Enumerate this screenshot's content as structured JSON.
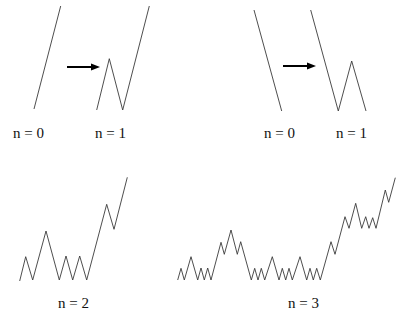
{
  "figure": {
    "stroke_color": "#3a3a3a",
    "arrow_color": "#000000",
    "background": "#ffffff"
  },
  "panels": [
    {
      "id": "top-left",
      "description": "Increasing generator: straight line (n = 0) replaced by zigzag (n = 1)",
      "n0": {
        "label": "n = 0",
        "points": [
          [
            34,
            109
          ],
          [
            60.7,
            6
          ]
        ]
      },
      "arrow": {
        "from": [
          67,
          67
        ],
        "to": [
          100,
          67
        ]
      },
      "n1": {
        "label": "n = 1",
        "points": [
          [
            96.7,
            110
          ],
          [
            109.3,
            58.7
          ],
          [
            122.7,
            110
          ],
          [
            149.3,
            6
          ]
        ]
      }
    },
    {
      "id": "top-right",
      "description": "Decreasing generator: straight line (n = 0) replaced by zigzag (n = 1)",
      "n0": {
        "label": "n = 0",
        "points": [
          [
            254,
            10
          ],
          [
            281.7,
            111
          ]
        ]
      },
      "arrow": {
        "from": [
          283,
          66
        ],
        "to": [
          316,
          66
        ]
      },
      "n1": {
        "label": "n = 1",
        "points": [
          [
            310.7,
            10
          ],
          [
            338.3,
            111
          ],
          [
            351.7,
            61
          ],
          [
            366,
            111
          ]
        ]
      }
    },
    {
      "id": "bottom-left",
      "description": "Second iteration",
      "n2": {
        "label": "n = 2",
        "points": [
          [
            19.7,
            281
          ],
          [
            25.7,
            256.7
          ],
          [
            32.7,
            280
          ],
          [
            46,
            231
          ],
          [
            59.3,
            280
          ],
          [
            66,
            256
          ],
          [
            72.7,
            280
          ],
          [
            79.7,
            256
          ],
          [
            86.7,
            280
          ],
          [
            106.7,
            204.3
          ],
          [
            114,
            229.3
          ],
          [
            127.3,
            177.3
          ]
        ]
      }
    },
    {
      "id": "bottom-right",
      "description": "Third iteration",
      "n3": {
        "label": "n = 3",
        "points": [
          [
            177.7,
            280
          ],
          [
            181,
            268.3
          ],
          [
            184.3,
            280
          ],
          [
            191,
            256.7
          ],
          [
            197.7,
            280
          ],
          [
            201,
            268
          ],
          [
            204.3,
            280
          ],
          [
            207.7,
            268
          ],
          [
            211,
            280
          ],
          [
            221,
            242.3
          ],
          [
            224.3,
            254.3
          ],
          [
            231,
            230
          ],
          [
            237.3,
            254.3
          ],
          [
            240.7,
            241.7
          ],
          [
            251.3,
            280
          ],
          [
            254.7,
            268.3
          ],
          [
            258,
            280
          ],
          [
            261.3,
            268.3
          ],
          [
            264.7,
            280
          ],
          [
            272.3,
            256.7
          ],
          [
            279,
            280
          ],
          [
            282.3,
            268.3
          ],
          [
            285.7,
            280
          ],
          [
            289,
            268.3
          ],
          [
            292.3,
            280
          ],
          [
            300,
            256.7
          ],
          [
            306.7,
            280
          ],
          [
            310,
            268.3
          ],
          [
            313.3,
            280
          ],
          [
            316.7,
            268.3
          ],
          [
            320.3,
            280
          ],
          [
            331,
            241.7
          ],
          [
            335,
            254.3
          ],
          [
            345,
            216.7
          ],
          [
            349,
            228.3
          ],
          [
            355.7,
            203.3
          ],
          [
            361.7,
            228.3
          ],
          [
            365.7,
            216.7
          ],
          [
            369,
            228.3
          ],
          [
            372.7,
            217.7
          ],
          [
            376,
            228.3
          ],
          [
            385.3,
            190
          ],
          [
            388.7,
            202.3
          ],
          [
            395.3,
            177.7
          ]
        ]
      }
    }
  ],
  "labels": {
    "top_left_n0": "n = 0",
    "top_left_n1": "n = 1",
    "top_right_n0": "n = 0",
    "top_right_n1": "n = 1",
    "bottom_left_n2": "n = 2",
    "bottom_right_n3": "n = 3"
  }
}
